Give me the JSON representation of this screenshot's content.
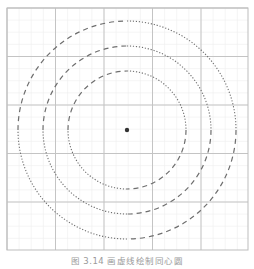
{
  "figure": {
    "caption": "图 3.14  画虚线绘制同心圆",
    "canvas": {
      "width": 254,
      "height": 254
    },
    "grid": {
      "origin": [
        7,
        8
      ],
      "size": [
        241,
        242
      ],
      "major_step": 48.5,
      "minor_divisions": 4,
      "major_color": "#c4c4c4",
      "minor_color": "#eeeeee",
      "border_color": "#bdbdbd"
    },
    "center": {
      "x": 127,
      "y": 130,
      "dot_radius": 2.2,
      "color": "#333333"
    },
    "circles": [
      {
        "name": "inner",
        "radius": 59
      },
      {
        "name": "middle",
        "radius": 84
      },
      {
        "name": "outer",
        "radius": 109
      }
    ],
    "stroke_color": "#6e6e6e",
    "quadrant_styles": {
      "top_right": "dotted",
      "bottom_left": "dotted",
      "top_left": "dashed",
      "bottom_right": "dashed"
    }
  }
}
